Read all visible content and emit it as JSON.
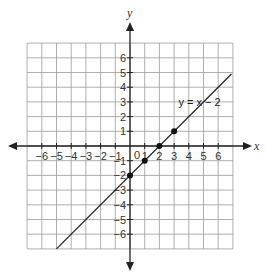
{
  "chart_data": {
    "type": "line",
    "title": "",
    "xlabel": "x",
    "ylabel": "y",
    "xlim": [
      -7,
      7
    ],
    "ylim": [
      -7,
      7
    ],
    "grid": true,
    "x_ticks": [
      -6,
      -5,
      -4,
      -3,
      -2,
      -1,
      0,
      1,
      2,
      3,
      4,
      5,
      6
    ],
    "y_ticks": [
      -6,
      -5,
      -4,
      -3,
      -2,
      -1,
      1,
      2,
      3,
      4,
      5,
      6
    ],
    "series": [
      {
        "name": "y = x − 2",
        "equation": "y = x - 2",
        "line_segment": [
          [
            -5,
            -7
          ],
          [
            6.9,
            4.9
          ]
        ],
        "points": [
          [
            0,
            -2
          ],
          [
            1,
            -1
          ],
          [
            2,
            0
          ],
          [
            3,
            1
          ]
        ]
      }
    ],
    "annotations": [
      {
        "text": "y = x − 2",
        "x": 3.3,
        "y": 3
      }
    ]
  },
  "labels": {
    "x_axis": "x",
    "y_axis": "y",
    "origin": "0",
    "equation": "y = x − 2"
  },
  "colors": {
    "grid": "#9a9a9a",
    "axis": "#222222",
    "line": "#222222",
    "point": "#111111"
  }
}
